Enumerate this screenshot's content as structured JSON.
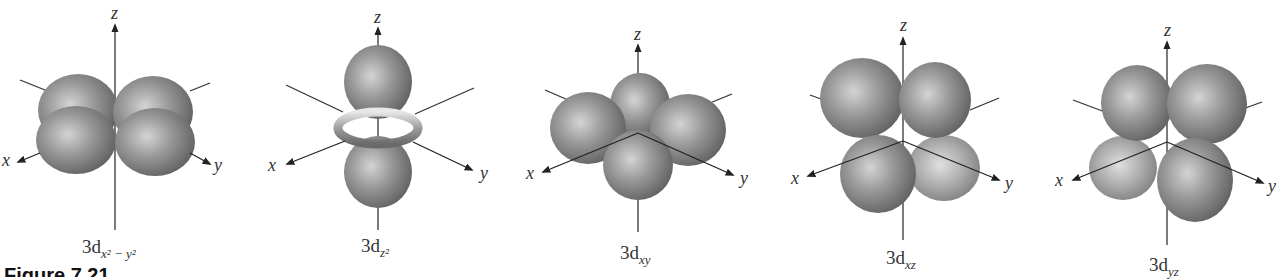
{
  "figure": {
    "caption_partial": "Figure 7.21",
    "style": {
      "lobe_color": "#8a8a8a",
      "highlight_color": "#d8d8d8",
      "axis_color": "#222222",
      "background": "#ffffff"
    }
  },
  "orbitals": [
    {
      "name": "3d_x2-y2",
      "label_main": "3d",
      "label_sub": "x² − y²",
      "axes": {
        "x": "x",
        "y": "y",
        "z": "z"
      }
    },
    {
      "name": "3d_z2",
      "label_main": "3d",
      "label_sub": "z²",
      "axes": {
        "x": "x",
        "y": "y",
        "z": "z"
      }
    },
    {
      "name": "3d_xy",
      "label_main": "3d",
      "label_sub": "xy",
      "axes": {
        "x": "x",
        "y": "y",
        "z": "z"
      }
    },
    {
      "name": "3d_xz",
      "label_main": "3d",
      "label_sub": "xz",
      "axes": {
        "x": "x",
        "y": "y",
        "z": "z"
      }
    },
    {
      "name": "3d_yz",
      "label_main": "3d",
      "label_sub": "yz",
      "axes": {
        "x": "x",
        "y": "y",
        "z": "z"
      }
    }
  ]
}
